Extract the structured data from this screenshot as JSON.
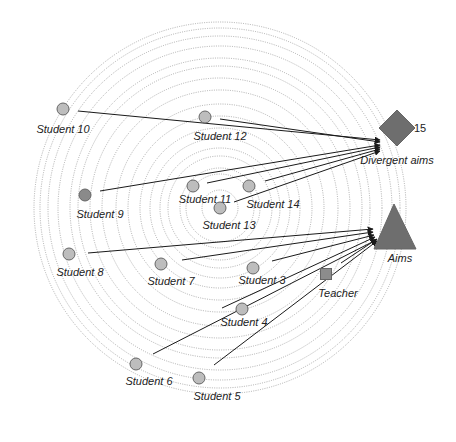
{
  "diagram": {
    "center": [
      220,
      208
    ],
    "ring_radii": [
      18,
      34,
      40,
      52,
      60,
      70,
      80,
      92,
      104,
      118,
      130,
      142,
      150,
      162,
      172,
      180,
      186
    ],
    "colors": {
      "ring": "#9a9a9a",
      "student_fill": "#bdbdbd",
      "student9_fill": "#8a8a8a",
      "target_fill": "#6e6e6e",
      "teacher_fill": "#8c8c8c",
      "line": "#1a1a1a"
    },
    "targets": {
      "divergent": {
        "label": "Divergent aims",
        "number": "15",
        "x": 397,
        "y": 128,
        "size": 18
      },
      "aims": {
        "label": "Aims",
        "x": 394,
        "y": 226,
        "size": 22
      }
    },
    "teacher": {
      "label": "Teacher",
      "x": 326,
      "y": 274
    },
    "students": [
      {
        "id": "student-10",
        "label": "Student 10",
        "x": 63,
        "y": 109,
        "fill": "#bdbdbd",
        "lx": 63,
        "ly": 133,
        "target": "divergent"
      },
      {
        "id": "student-12",
        "label": "Student 12",
        "x": 205,
        "y": 117,
        "fill": "#bdbdbd",
        "lx": 220,
        "ly": 140,
        "target": "divergent"
      },
      {
        "id": "student-9",
        "label": "Student 9",
        "x": 85,
        "y": 195,
        "fill": "#8a8a8a",
        "lx": 100,
        "ly": 218,
        "target": "divergent"
      },
      {
        "id": "student-11",
        "label": "Student 11",
        "x": 193,
        "y": 186,
        "fill": "#bdbdbd",
        "lx": 205,
        "ly": 203,
        "target": "divergent"
      },
      {
        "id": "student-14",
        "label": "Student 14",
        "x": 249,
        "y": 186,
        "fill": "#bdbdbd",
        "lx": 273,
        "ly": 208,
        "target": "divergent"
      },
      {
        "id": "student-13",
        "label": "Student 13",
        "x": 220,
        "y": 208,
        "fill": "#bdbdbd",
        "lx": 229,
        "ly": 229,
        "target": "divergent"
      },
      {
        "id": "student-8",
        "label": "Student 8",
        "x": 69,
        "y": 254,
        "fill": "#bdbdbd",
        "lx": 80,
        "ly": 276,
        "target": "aims"
      },
      {
        "id": "student-7",
        "label": "Student 7",
        "x": 161,
        "y": 264,
        "fill": "#bdbdbd",
        "lx": 171,
        "ly": 285,
        "target": "aims"
      },
      {
        "id": "student-3",
        "label": "Student 3",
        "x": 253,
        "y": 268,
        "fill": "#bdbdbd",
        "lx": 262,
        "ly": 284,
        "target": "aims"
      },
      {
        "id": "student-4",
        "label": "Student 4",
        "x": 242,
        "y": 309,
        "fill": "#bdbdbd",
        "lx": 244,
        "ly": 326,
        "target": "aims"
      },
      {
        "id": "student-6",
        "label": "Student 6",
        "x": 136,
        "y": 364,
        "fill": "#bdbdbd",
        "lx": 149,
        "ly": 385,
        "target": "aims"
      },
      {
        "id": "student-5",
        "label": "Student 5",
        "x": 199,
        "y": 378,
        "fill": "#bdbdbd",
        "lx": 217,
        "ly": 400,
        "target": "aims"
      }
    ],
    "links": [
      {
        "from": [
          78,
          111
        ],
        "to": [
          380,
          140
        ]
      },
      {
        "from": [
          220,
          119
        ],
        "to": [
          380,
          142
        ]
      },
      {
        "from": [
          100,
          191
        ],
        "to": [
          380,
          145
        ]
      },
      {
        "from": [
          207,
          183
        ],
        "to": [
          380,
          147
        ]
      },
      {
        "from": [
          265,
          181
        ],
        "to": [
          380,
          149
        ]
      },
      {
        "from": [
          234,
          202
        ],
        "to": [
          380,
          151
        ]
      },
      {
        "from": [
          88,
          253
        ],
        "to": [
          373,
          229
        ]
      },
      {
        "from": [
          182,
          260
        ],
        "to": [
          373,
          232
        ]
      },
      {
        "from": [
          272,
          261
        ],
        "to": [
          374,
          235
        ]
      },
      {
        "from": [
          222,
          308
        ],
        "to": [
          375,
          237
        ]
      },
      {
        "from": [
          153,
          354
        ],
        "to": [
          376,
          240
        ]
      },
      {
        "from": [
          214,
          365
        ],
        "to": [
          377,
          241
        ]
      },
      {
        "from": [
          341,
          263
        ],
        "to": [
          377,
          239
        ]
      }
    ]
  }
}
